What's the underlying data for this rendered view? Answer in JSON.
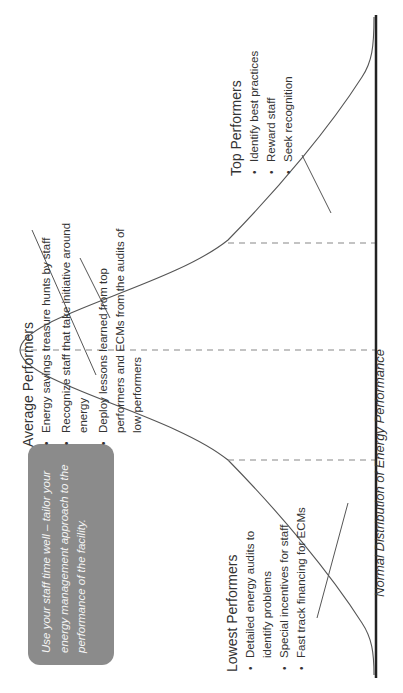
{
  "diagram": {
    "orientation": "rotated 90 degrees counter-clockwise",
    "axis_caption": "Normal Distribution of Energy Performance",
    "callout": {
      "text": "Use your staff time well – tailor your energy management approach to the performance of the facility.",
      "background_color": "#8b8b8b",
      "text_color": "#f4f4f4"
    },
    "groups": {
      "lowest": {
        "title": "Lowest Performers",
        "items": [
          "Detailed energy audits to identify problems",
          "Special incentives for staff",
          "Fast track financing for ECMs"
        ]
      },
      "average": {
        "title": "Average Performers",
        "items": [
          "Energy savings treasure hunts by staff",
          "Recognize staff that take initiative around energy",
          "Deploy lessons learned from top performers and ECMs from the audits of low performers"
        ]
      },
      "top": {
        "title": "Top Performers",
        "items": [
          "Identify best practices",
          "Reward staff",
          "Seek recognition"
        ]
      }
    },
    "colors": {
      "curve": "#555555",
      "axis": "#222222",
      "dashes": "#888888"
    }
  }
}
